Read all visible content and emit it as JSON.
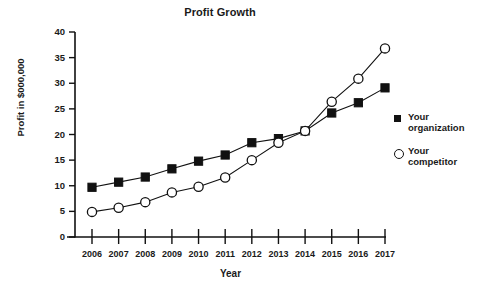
{
  "chart_data": {
    "type": "line",
    "title": "Profit Growth",
    "xlabel": "Year",
    "ylabel": "Profit in $000,000",
    "categories": [
      "2006",
      "2007",
      "2008",
      "2009",
      "2010",
      "2011",
      "2012",
      "2013",
      "2014",
      "2015",
      "2016",
      "2017"
    ],
    "x": [
      2006,
      2007,
      2008,
      2009,
      2010,
      2011,
      2012,
      2013,
      2014,
      2015,
      2016,
      2017
    ],
    "xlim": [
      2006,
      2017
    ],
    "ylim": [
      0,
      40
    ],
    "yticks": [
      0,
      5,
      10,
      15,
      20,
      25,
      30,
      35,
      40
    ],
    "ytick_labels": [
      "0",
      "5",
      "10",
      "15",
      "20",
      "25",
      "30",
      "35",
      "40"
    ],
    "grid": false,
    "legend_position": "right",
    "series": [
      {
        "name": "Your organization",
        "name_line1": "Your",
        "name_line2": "organization",
        "marker": "filled-square",
        "color": "#111111",
        "values": [
          9.7,
          10.7,
          11.7,
          13.3,
          14.8,
          16.0,
          18.4,
          19.2,
          20.7,
          24.2,
          26.2,
          29.1
        ]
      },
      {
        "name": "Your competitor",
        "name_line1": "Your",
        "name_line2": "competitor",
        "marker": "open-circle",
        "color": "#111111",
        "values": [
          4.9,
          5.7,
          6.8,
          8.7,
          9.8,
          11.6,
          15.0,
          18.4,
          20.7,
          26.4,
          30.9,
          36.8
        ]
      }
    ]
  },
  "colors": {
    "axis": "#111111",
    "background": "#ffffff",
    "text": "#1a1a1a"
  }
}
